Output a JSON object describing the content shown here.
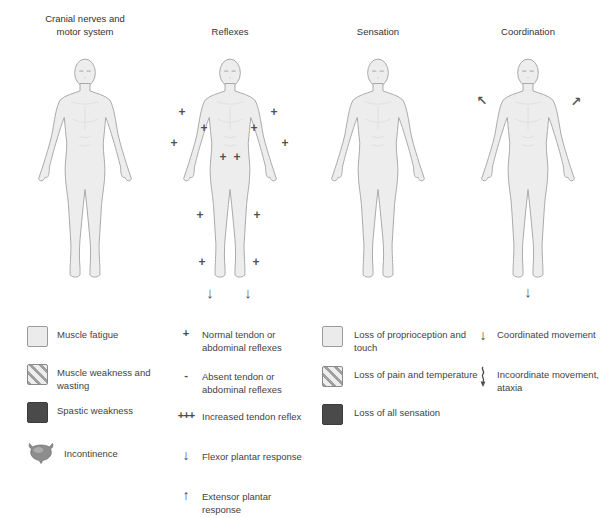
{
  "figures": [
    {
      "id": "cranial-motor",
      "title": "Cranial nerves and\nmotor system",
      "markers": []
    },
    {
      "id": "reflexes",
      "title": "Reflexes",
      "markers": [
        {
          "glyph": "+",
          "x": 11.3,
          "y": 22.0,
          "name": "tendon-reflex-plus-marker"
        },
        {
          "glyph": "+",
          "x": 85.5,
          "y": 22.0,
          "name": "tendon-reflex-plus-marker"
        },
        {
          "glyph": "+",
          "x": 29.0,
          "y": 28.4,
          "name": "tendon-reflex-plus-marker"
        },
        {
          "glyph": "+",
          "x": 69.4,
          "y": 28.4,
          "name": "tendon-reflex-plus-marker"
        },
        {
          "glyph": "+",
          "x": 4.8,
          "y": 34.4,
          "name": "tendon-reflex-plus-marker"
        },
        {
          "glyph": "+",
          "x": 94.4,
          "y": 34.4,
          "name": "tendon-reflex-plus-marker"
        },
        {
          "glyph": "+",
          "x": 44.4,
          "y": 40.0,
          "name": "abdominal-reflex-plus-marker"
        },
        {
          "glyph": "+",
          "x": 55.6,
          "y": 40.0,
          "name": "abdominal-reflex-plus-marker"
        },
        {
          "glyph": "+",
          "x": 25.8,
          "y": 63.2,
          "name": "knee-reflex-plus-marker"
        },
        {
          "glyph": "+",
          "x": 71.8,
          "y": 63.2,
          "name": "knee-reflex-plus-marker"
        },
        {
          "glyph": "+",
          "x": 27.4,
          "y": 82.0,
          "name": "ankle-reflex-plus-marker"
        },
        {
          "glyph": "+",
          "x": 71.0,
          "y": 82.0,
          "name": "ankle-reflex-plus-marker"
        },
        {
          "glyph": "↓",
          "x": 33.9,
          "y": 94.0,
          "name": "flexor-plantar-arrow"
        },
        {
          "glyph": "↓",
          "x": 64.5,
          "y": 94.0,
          "name": "flexor-plantar-arrow"
        }
      ]
    },
    {
      "id": "sensation",
      "title": "Sensation",
      "markers": []
    },
    {
      "id": "coordination",
      "title": "Coordination",
      "markers": [
        {
          "glyph": "↖",
          "x": 12.9,
          "y": 17.2,
          "name": "coordination-diagonal-arrow"
        },
        {
          "glyph": "↗",
          "x": 88.7,
          "y": 17.6,
          "name": "coordination-diagonal-arrow"
        },
        {
          "glyph": "↓",
          "x": 50.0,
          "y": 93.6,
          "name": "coordination-down-arrow"
        }
      ]
    }
  ],
  "legend": {
    "motor": [
      {
        "symbol": "light-square",
        "label": "Muscle fatigue"
      },
      {
        "symbol": "hatched-square",
        "label": "Muscle weakness and\nwasting"
      },
      {
        "symbol": "dark-square",
        "label": "Spastic weakness"
      },
      {
        "symbol": "bladder",
        "label": "Incontinence"
      }
    ],
    "reflexes": [
      {
        "symbol": "+",
        "label": "Normal tendon or\nabdominal reflexes"
      },
      {
        "symbol": "-",
        "label": "Absent tendon or\nabdominal reflexes"
      },
      {
        "symbol": "+++",
        "label": "Increased tendon reflex"
      },
      {
        "symbol": "↓",
        "label": "Flexor plantar response"
      },
      {
        "symbol": "↑",
        "label": "Extensor plantar response"
      }
    ],
    "sensation": [
      {
        "symbol": "light-square",
        "label": "Loss of proprioception and\ntouch"
      },
      {
        "symbol": "hatched-square",
        "label": "Loss of pain and temperature"
      },
      {
        "symbol": "dark-square",
        "label": "Loss of all sensation"
      }
    ],
    "coordination": [
      {
        "symbol": "↓",
        "label": "Coordinated movement"
      },
      {
        "symbol": "wavy-down-arrow",
        "label": "Incoordinate movement,\nataxia"
      }
    ]
  },
  "colors": {
    "body_fill": "#ededed",
    "body_outline": "#a9a9a9",
    "marker": "#4f4f4f",
    "swatch_light": "#ebebeb",
    "swatch_dark": "#4a4a4a",
    "text": "#3f3f3f"
  }
}
